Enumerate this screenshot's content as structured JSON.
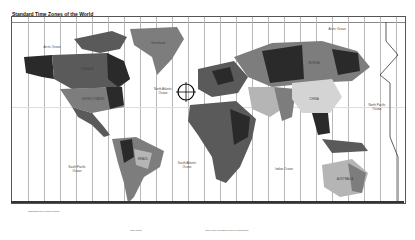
{
  "map": {
    "title": "Standard Time Zones of the World",
    "labels": {
      "arctic_ocean_left": "Arctic Ocean",
      "arctic_ocean_right": "Arctic Ocean",
      "north_pacific_left": "North Pacific Ocean",
      "south_pacific": "South Pacific Ocean",
      "north_atlantic": "North Atlantic Ocean",
      "south_atlantic": "South Atlantic Ocean",
      "indian_ocean": "Indian Ocean",
      "north_pacific_right": "North Pacific Ocean",
      "canada": "CANADA",
      "united_states": "UNITED STATES",
      "greenland": "Greenland",
      "russia": "RUSSIA",
      "china": "CHINA",
      "australia": "AUSTRALIA",
      "brazil": "BRAZIL"
    },
    "colors": {
      "dark": "#2a2a2a",
      "mid_dark": "#5a5a5a",
      "mid": "#7d7d7d",
      "light": "#b5b5b5",
      "lighter": "#d4d4d4",
      "ocean": "#ffffff"
    },
    "legend_notes": "Standard time zones legend",
    "footer_note_left": "Map notes",
    "footer_note_right": "Time zone boundaries as of publication"
  }
}
